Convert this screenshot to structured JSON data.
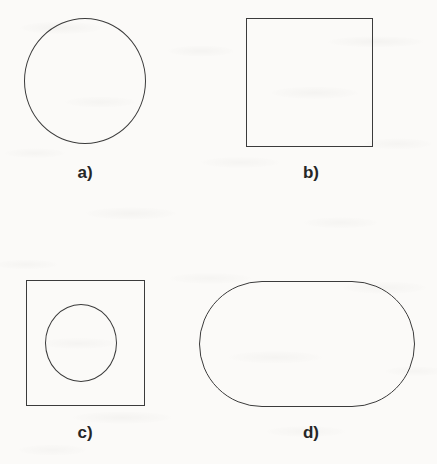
{
  "figure": {
    "background_color": "#fbfaf8",
    "stroke_color": "#3b3b3b",
    "label_color": "#262626",
    "panels": [
      {
        "key": "a",
        "label": "a)",
        "shape_name": "circle",
        "description": "open circle outline",
        "geometry": {
          "x": 24,
          "y": 18,
          "width": 122,
          "height": 126
        }
      },
      {
        "key": "b",
        "label": "b)",
        "shape_name": "square",
        "description": "open square outline",
        "geometry": {
          "x": 246,
          "y": 18,
          "width": 127,
          "height": 129
        }
      },
      {
        "key": "c",
        "label": "c)",
        "shape_name": "square-with-inscribed-circle",
        "description": "square outline containing a smaller circle outline",
        "geometry": {
          "x": 26,
          "y": 280,
          "width": 119,
          "height": 126
        },
        "inner_geometry": {
          "x": 45,
          "y": 304,
          "width": 72,
          "height": 78
        }
      },
      {
        "key": "d",
        "label": "d)",
        "shape_name": "stadium",
        "description": "horizontal rounded rectangle with semicircular ends",
        "geometry": {
          "x": 199,
          "y": 281,
          "width": 216,
          "height": 126
        }
      }
    ]
  }
}
